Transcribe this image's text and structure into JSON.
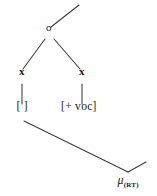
{
  "figure": {
    "kind": "autosegmental-phonology-tree",
    "width": 157,
    "height": 196,
    "background_color": "#fefefe",
    "ink_color": "#3a3a3a",
    "text_color": "#1a1a1a"
  },
  "nodes": {
    "root": {
      "label": "o",
      "x": 49,
      "y": 33
    },
    "skeletal_left": {
      "label": "x",
      "x": 22,
      "y": 77
    },
    "skeletal_right": {
      "label": "x",
      "x": 82,
      "y": 77
    },
    "feature_left": {
      "label": "[ ]",
      "x": 22,
      "y": 113
    },
    "feature_right": {
      "label": "[+ voc]",
      "x": 79,
      "y": 113
    },
    "mora": {
      "label": "μ",
      "subscript": "(RT)",
      "x": 128,
      "y": 186
    }
  },
  "edges": [
    {
      "name": "edge-root-upward",
      "from": [
        51,
        27
      ],
      "to": [
        79,
        5
      ]
    },
    {
      "name": "edge-root-to-left-x",
      "from": [
        45,
        39
      ],
      "to": [
        23,
        69
      ]
    },
    {
      "name": "edge-root-to-right-x",
      "from": [
        54,
        39
      ],
      "to": [
        80,
        69
      ]
    },
    {
      "name": "edge-left-x-to-feature",
      "from": [
        22,
        84
      ],
      "to": [
        22,
        104
      ]
    },
    {
      "name": "edge-right-x-to-feature",
      "from": [
        82,
        84
      ],
      "to": [
        82,
        104
      ]
    },
    {
      "name": "edge-feature-left-to-mora",
      "from": [
        24,
        121
      ],
      "to": [
        128,
        172
      ]
    },
    {
      "name": "edge-mora-upward-right",
      "from": [
        128,
        172
      ],
      "to": [
        146,
        162
      ]
    }
  ],
  "legend": {
    "root_tier": "root node",
    "skeletal_tier": "timing slots",
    "feature_tier": "feature bundles",
    "moraic_tier": "mora"
  }
}
